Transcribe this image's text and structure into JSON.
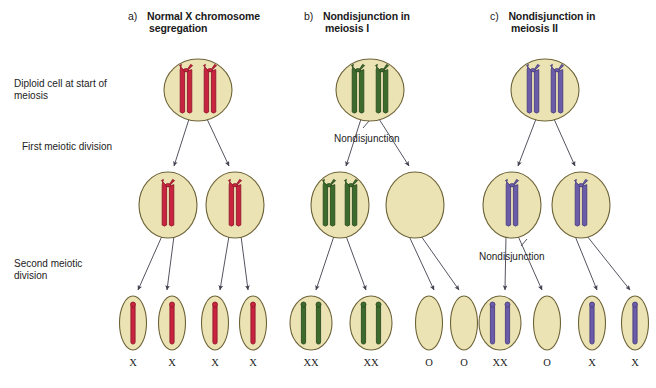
{
  "figure": {
    "title_panels": [
      {
        "letter": "a)",
        "title_line1": "Normal X chromosome",
        "title_line2": "segregation"
      },
      {
        "letter": "b)",
        "title_line1": "Nondisjunction in",
        "title_line2": "meiosis I"
      },
      {
        "letter": "c)",
        "title_line1": "Nondisjunction in",
        "title_line2": "meiosis II"
      }
    ],
    "stage_labels": [
      {
        "line1": "Diploid cell at start of",
        "line2": "meiosis"
      },
      {
        "line1": "First meiotic division",
        "line2": ""
      },
      {
        "line1": "Second meiotic",
        "line2": "division"
      }
    ],
    "annotations": [
      {
        "text": "Nondisjunction",
        "panel": "b",
        "stage": "meiosis-I"
      },
      {
        "text": "Nondisjunction",
        "panel": "c",
        "stage": "meiosis-II"
      }
    ],
    "colors": {
      "chromosome_red": "#c8243f",
      "chromosome_red_dark": "#8e1528",
      "chromosome_green": "#3d6b2e",
      "chromosome_green_dark": "#28491d",
      "chromosome_purple": "#6a5ca8",
      "chromosome_purple_dark": "#473b7c",
      "cell_fill": "#ece3b4",
      "cell_border": "#6d6338",
      "arrow": "#4a4a5a",
      "background": "#ffffff",
      "text": "#1c1c1c"
    },
    "panels": [
      {
        "id": "a",
        "parent_cell": {
          "chromosomes": 2,
          "type": "replicated",
          "color": "red"
        },
        "meiosis_i_cells": [
          {
            "chromosomes": 1,
            "type": "replicated",
            "color": "red"
          },
          {
            "chromosomes": 1,
            "type": "replicated",
            "color": "red"
          }
        ],
        "gametes": [
          {
            "label": "X",
            "chromosomes": 1,
            "color": "red"
          },
          {
            "label": "X",
            "chromosomes": 1,
            "color": "red"
          },
          {
            "label": "X",
            "chromosomes": 1,
            "color": "red"
          },
          {
            "label": "X",
            "chromosomes": 1,
            "color": "red"
          }
        ]
      },
      {
        "id": "b",
        "parent_cell": {
          "chromosomes": 2,
          "type": "replicated",
          "color": "green"
        },
        "meiosis_i_cells": [
          {
            "chromosomes": 2,
            "type": "replicated",
            "color": "green"
          },
          {
            "chromosomes": 0,
            "type": "empty",
            "color": "green"
          }
        ],
        "gametes": [
          {
            "label": "XX",
            "chromosomes": 2,
            "color": "green"
          },
          {
            "label": "XX",
            "chromosomes": 2,
            "color": "green"
          },
          {
            "label": "O",
            "chromosomes": 0,
            "color": "green"
          },
          {
            "label": "O",
            "chromosomes": 0,
            "color": "green"
          }
        ]
      },
      {
        "id": "c",
        "parent_cell": {
          "chromosomes": 2,
          "type": "replicated",
          "color": "purple"
        },
        "meiosis_i_cells": [
          {
            "chromosomes": 1,
            "type": "replicated",
            "color": "purple"
          },
          {
            "chromosomes": 1,
            "type": "replicated",
            "color": "purple"
          }
        ],
        "gametes": [
          {
            "label": "XX",
            "chromosomes": 2,
            "color": "purple"
          },
          {
            "label": "O",
            "chromosomes": 0,
            "color": "purple"
          },
          {
            "label": "X",
            "chromosomes": 1,
            "color": "purple"
          },
          {
            "label": "X",
            "chromosomes": 1,
            "color": "purple"
          }
        ]
      }
    ]
  }
}
